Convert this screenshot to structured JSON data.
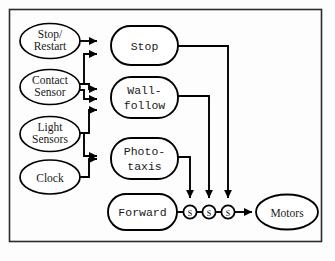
{
  "diagram": {
    "type": "block-diagram",
    "frame": {
      "stroke": "#2b2b2b",
      "fill": "#fdfdfd"
    },
    "colors": {
      "line": "#000000",
      "node_fill": "#ffffff",
      "node_stroke": "#000000",
      "text": "#1a1a1a"
    },
    "inputs": [
      {
        "id": "stop-restart",
        "label_line1": "Stop/",
        "label_line2": "Restart"
      },
      {
        "id": "contact-sensor",
        "label_line1": "Contact",
        "label_line2": "Sensor"
      },
      {
        "id": "light-sensors",
        "label_line1": "Light",
        "label_line2": "Sensors"
      },
      {
        "id": "clock",
        "label_line1": "Clock",
        "label_line2": ""
      }
    ],
    "behaviors": [
      {
        "id": "stop",
        "label_line1": "Stop",
        "label_line2": ""
      },
      {
        "id": "wall-follow",
        "label_line1": "Wall-",
        "label_line2": "follow"
      },
      {
        "id": "photo-taxis",
        "label_line1": "Photo-",
        "label_line2": "taxis"
      },
      {
        "id": "forward",
        "label_line1": "Forward",
        "label_line2": ""
      }
    ],
    "suppressors": [
      {
        "id": "suppressor-1",
        "label": "S"
      },
      {
        "id": "suppressor-2",
        "label": "S"
      },
      {
        "id": "suppressor-3",
        "label": "S"
      }
    ],
    "output": {
      "id": "motors",
      "label": "Motors"
    },
    "edges": [
      {
        "from": "stop-restart",
        "to": "stop"
      },
      {
        "from": "contact-sensor",
        "to": "stop"
      },
      {
        "from": "contact-sensor",
        "to": "wall-follow"
      },
      {
        "from": "contact-sensor",
        "to": "wall-follow"
      },
      {
        "from": "light-sensors",
        "to": "wall-follow"
      },
      {
        "from": "light-sensors",
        "to": "photo-taxis"
      },
      {
        "from": "clock",
        "to": "photo-taxis"
      },
      {
        "from": "stop",
        "to": "suppressor-3"
      },
      {
        "from": "wall-follow",
        "to": "suppressor-2"
      },
      {
        "from": "photo-taxis",
        "to": "suppressor-1"
      },
      {
        "from": "forward",
        "to": "suppressor-1"
      },
      {
        "from": "suppressor-1",
        "to": "suppressor-2"
      },
      {
        "from": "suppressor-2",
        "to": "suppressor-3"
      },
      {
        "from": "suppressor-3",
        "to": "motors"
      }
    ]
  }
}
